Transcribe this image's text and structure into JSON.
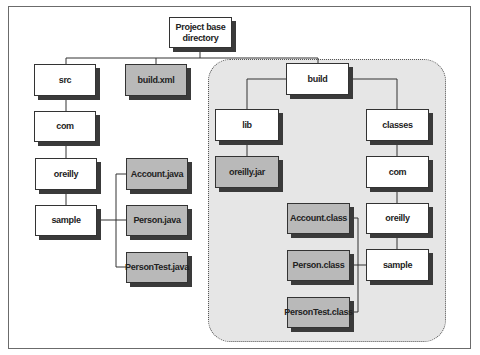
{
  "diagram": {
    "root": "Project base directory",
    "root_lines": [
      "Project base",
      "directory"
    ],
    "nodes": {
      "src": "src",
      "build_xml": "build.xml",
      "src_com": "com",
      "src_oreilly": "oreilly",
      "src_sample": "sample",
      "account_java": "Account.java",
      "person_java": "Person.java",
      "persontest_java": "PersonTest.java",
      "build": "build",
      "lib": "lib",
      "oreilly_jar": "oreilly.jar",
      "classes": "classes",
      "classes_com": "com",
      "classes_oreilly": "oreilly",
      "classes_sample": "sample",
      "account_class": "Account.class",
      "person_class": "Person.class",
      "persontest_class": "PersonTest.class"
    },
    "node_kinds": {
      "directory_fill": "#ffffff",
      "file_fill": "#b9b9b9",
      "build_region_fill": "#e6e6e6"
    },
    "edges": [
      [
        "Project base directory",
        "src"
      ],
      [
        "Project base directory",
        "build.xml"
      ],
      [
        "Project base directory",
        "build"
      ],
      [
        "src",
        "com"
      ],
      [
        "com",
        "oreilly"
      ],
      [
        "oreilly",
        "sample"
      ],
      [
        "sample",
        "Account.java"
      ],
      [
        "sample",
        "Person.java"
      ],
      [
        "sample",
        "PersonTest.java"
      ],
      [
        "build",
        "lib"
      ],
      [
        "build",
        "classes"
      ],
      [
        "lib",
        "oreilly.jar"
      ],
      [
        "classes",
        "com"
      ],
      [
        "com",
        "oreilly"
      ],
      [
        "oreilly",
        "sample"
      ],
      [
        "sample",
        "Account.class"
      ],
      [
        "sample",
        "Person.class"
      ],
      [
        "sample",
        "PersonTest.class"
      ]
    ]
  }
}
